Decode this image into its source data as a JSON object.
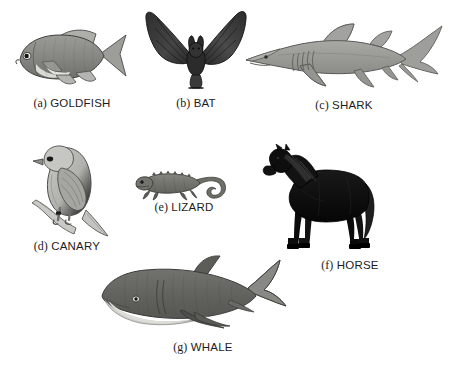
{
  "figure": {
    "background_color": "#ffffff",
    "width": 460,
    "height": 366,
    "items": [
      {
        "enum": "(a)",
        "name": "GOLDFISH",
        "icon": "goldfish-illustration",
        "colors": {
          "body": "#8d8d8d",
          "belly": "#d6d6d2",
          "outline": "#3a3a3a",
          "fin": "#a9a9a5"
        }
      },
      {
        "enum": "(b)",
        "name": "BAT",
        "icon": "bat-illustration",
        "colors": {
          "body": "#3b3b3b",
          "wing": "#4a4a4a",
          "outline": "#1d1d1d"
        }
      },
      {
        "enum": "(c)",
        "name": "SHARK",
        "icon": "shark-illustration",
        "colors": {
          "body": "#9c9c98",
          "outline": "#5a5a56",
          "gill": "#6e6e6a"
        }
      },
      {
        "enum": "(d)",
        "name": "CANARY",
        "icon": "canary-illustration",
        "colors": {
          "body": "#b8b8b4",
          "wing": "#9a9a96",
          "outline": "#4a4a46",
          "branch": "#c3c3bf"
        }
      },
      {
        "enum": "(e)",
        "name": "LIZARD",
        "icon": "lizard-illustration",
        "colors": {
          "body": "#757571",
          "outline": "#4a4a46"
        }
      },
      {
        "enum": "(f)",
        "name": "HORSE",
        "icon": "horse-illustration",
        "colors": {
          "body": "#0e0e0e",
          "mane": "#2b2b2b",
          "outline": "#000000"
        }
      },
      {
        "enum": "(g)",
        "name": "WHALE",
        "icon": "whale-illustration",
        "colors": {
          "body": "#6e6e6a",
          "belly": "#cfcfcb",
          "outline": "#3f3f3b",
          "fin": "#858581"
        }
      }
    ]
  }
}
